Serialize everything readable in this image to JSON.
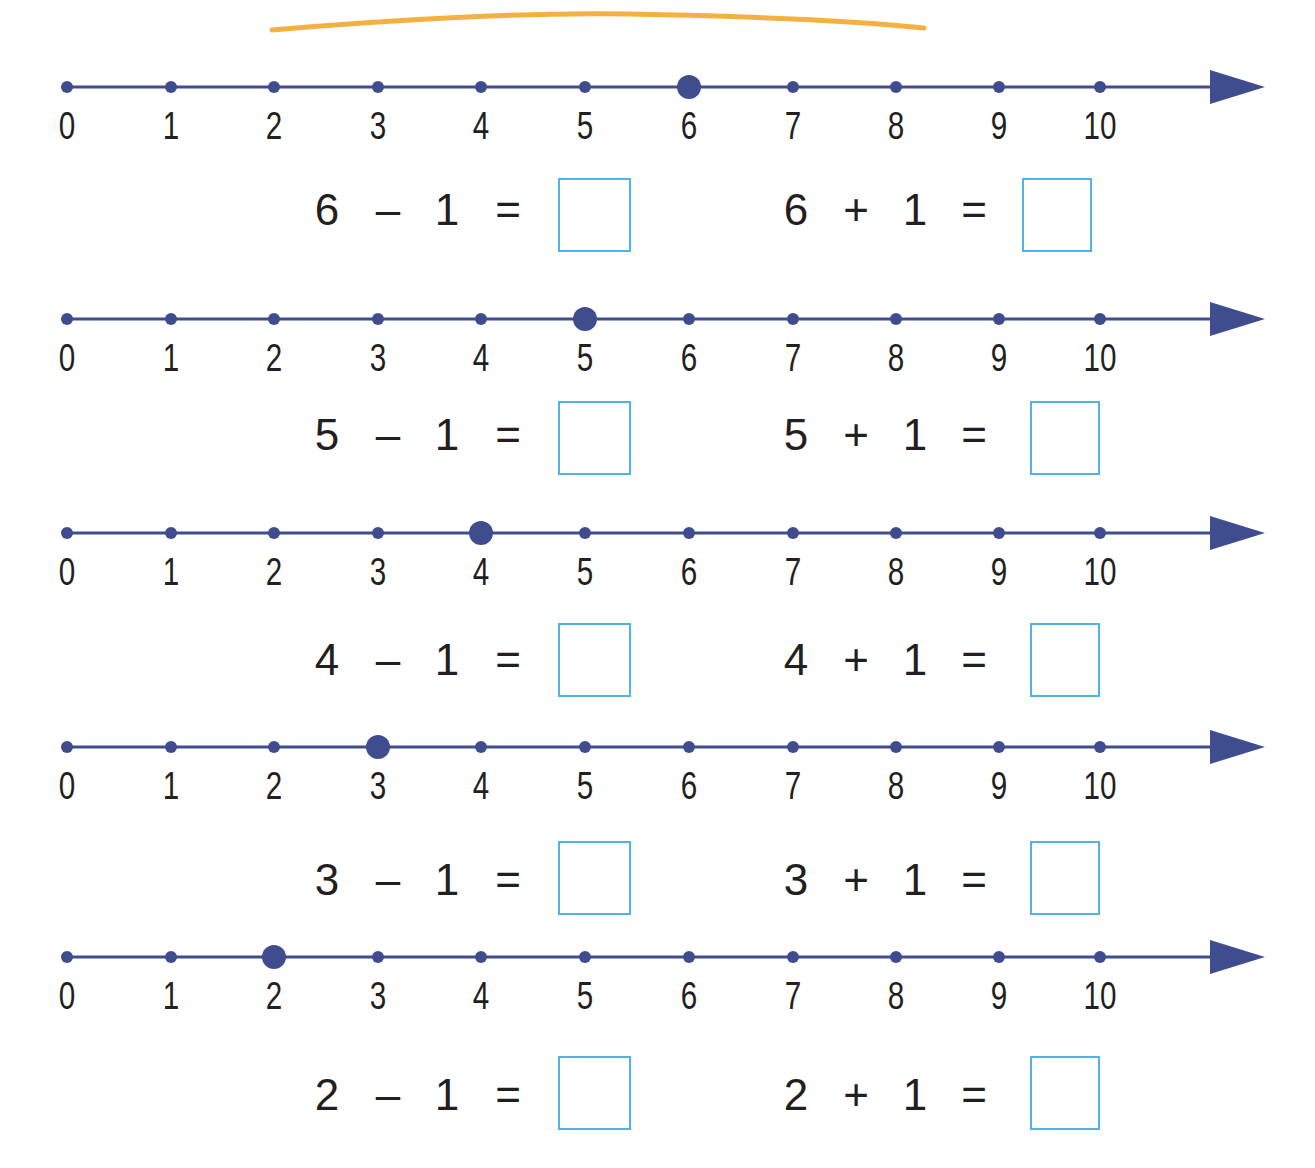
{
  "worksheet": {
    "colors": {
      "line": "#3f4d8f",
      "point": "#3f4d8f",
      "answer_box_border": "#4fb3e8",
      "text": "#231f20",
      "decoration": "#f3a92e"
    },
    "tick_labels": [
      "0",
      "1",
      "2",
      "3",
      "4",
      "5",
      "6",
      "7",
      "8",
      "9",
      "10"
    ],
    "rows": [
      {
        "highlighted": 6,
        "subtraction": {
          "a": "6",
          "op": "–",
          "b": "1",
          "eq": "=",
          "answer": ""
        },
        "addition": {
          "a": "6",
          "op": "+",
          "b": "1",
          "eq": "=",
          "answer": ""
        }
      },
      {
        "highlighted": 5,
        "subtraction": {
          "a": "5",
          "op": "–",
          "b": "1",
          "eq": "=",
          "answer": ""
        },
        "addition": {
          "a": "5",
          "op": "+",
          "b": "1",
          "eq": "=",
          "answer": ""
        }
      },
      {
        "highlighted": 4,
        "subtraction": {
          "a": "4",
          "op": "–",
          "b": "1",
          "eq": "=",
          "answer": ""
        },
        "addition": {
          "a": "4",
          "op": "+",
          "b": "1",
          "eq": "=",
          "answer": ""
        }
      },
      {
        "highlighted": 3,
        "subtraction": {
          "a": "3",
          "op": "–",
          "b": "1",
          "eq": "=",
          "answer": ""
        },
        "addition": {
          "a": "3",
          "op": "+",
          "b": "1",
          "eq": "=",
          "answer": ""
        }
      },
      {
        "highlighted": 2,
        "subtraction": {
          "a": "2",
          "op": "–",
          "b": "1",
          "eq": "=",
          "answer": ""
        },
        "addition": {
          "a": "2",
          "op": "+",
          "b": "1",
          "eq": "=",
          "answer": ""
        }
      }
    ]
  }
}
